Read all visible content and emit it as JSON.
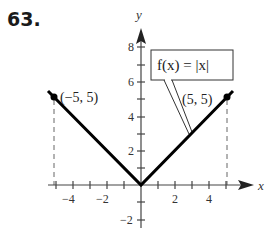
{
  "problem_number": "63.",
  "function_label": "f(x) = |x|",
  "axes": {
    "x_label": "x",
    "y_label": "y",
    "x_ticks": [
      "−4",
      "−2",
      "2",
      "4"
    ],
    "y_ticks": [
      "8",
      "6",
      "4",
      "2",
      "−2"
    ]
  },
  "points": [
    {
      "label": "(−5, 5)",
      "x": -5,
      "y": 5
    },
    {
      "label": "(5, 5)",
      "x": 5,
      "y": 5
    }
  ],
  "colors": {
    "graph": "#000000",
    "axes": "#444444",
    "dashed": "#666666"
  }
}
